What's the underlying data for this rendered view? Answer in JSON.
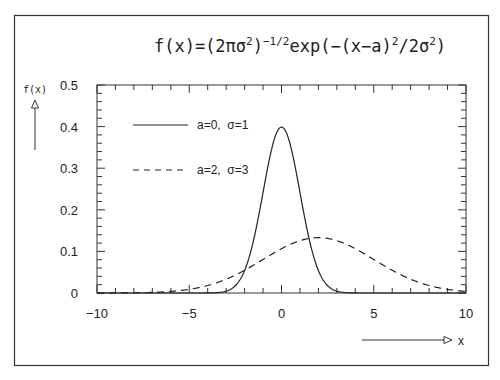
{
  "chart_data": {
    "type": "line",
    "title_parts": {
      "prefix": "f(x)=(2πσ",
      "sup1": "2",
      "mid1": ")",
      "sup2": "−1/2",
      "mid2": "exp(−(x−a)",
      "sup3": "2",
      "mid3": "/2σ",
      "sup4": "2",
      "suffix": ")"
    },
    "xlabel": "x",
    "ylabel": "f(x)",
    "xlim": [
      -10,
      10
    ],
    "ylim": [
      0,
      0.5
    ],
    "xticks": [
      -10,
      -5,
      0,
      5,
      10
    ],
    "xtick_labels": [
      "−10",
      "−5",
      "0",
      "5",
      "10"
    ],
    "yticks": [
      0,
      0.1,
      0.2,
      0.3,
      0.4,
      0.5
    ],
    "ytick_labels": [
      "0",
      "0.1",
      "0.2",
      "0.3",
      "0.4",
      "0.5"
    ],
    "x_minor_step": 1,
    "y_minor_step": 0.02,
    "grid": false,
    "legend_position": "upper-left-inside",
    "series": [
      {
        "name": "a=0,  σ=1",
        "style": "solid",
        "mean": 0,
        "sigma": 1,
        "peak": 0.399
      },
      {
        "name": "a=2,  σ=3",
        "style": "dashed",
        "mean": 2,
        "sigma": 3,
        "peak": 0.133
      }
    ]
  },
  "colors": {
    "line": "#222222",
    "frame": "#333333",
    "background": "#ffffff"
  }
}
